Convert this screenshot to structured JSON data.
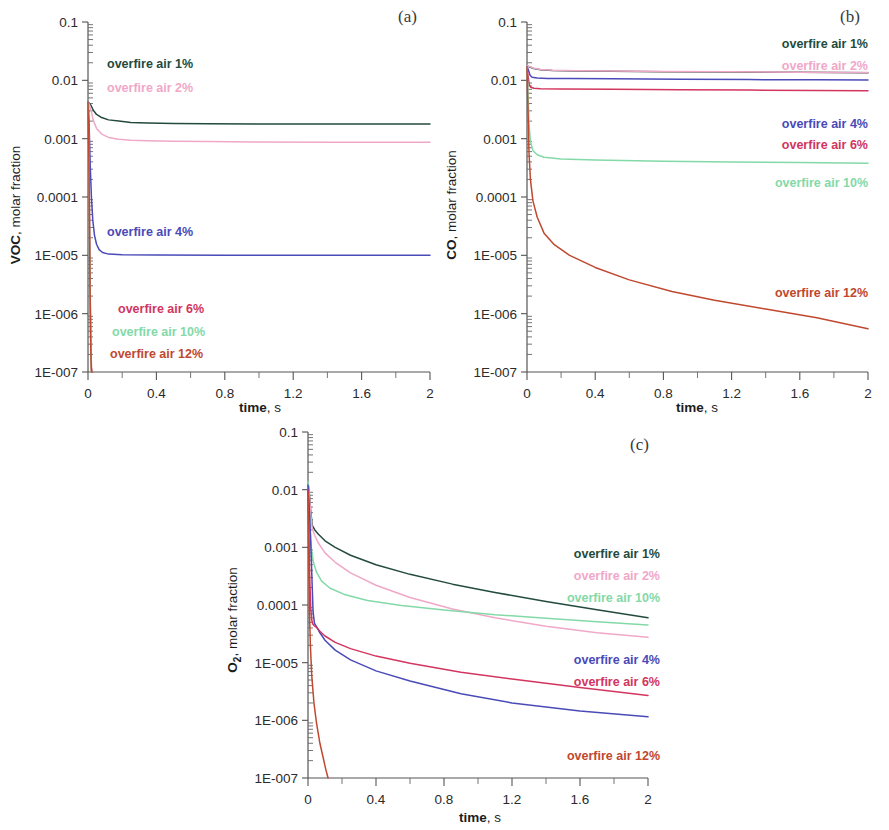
{
  "figure": {
    "panels": [
      {
        "tag": "(a)",
        "species": "VOC",
        "ylabel_unit": ", molar fraction",
        "xlabel_bold": "time",
        "xlabel_rest": ", s"
      },
      {
        "tag": "(b)",
        "species": "CO",
        "ylabel_unit": ", molar fraction",
        "xlabel_bold": "time",
        "xlabel_rest": ", s"
      },
      {
        "tag": "(c)",
        "species": "O2",
        "species_sub": "2",
        "ylabel_unit": ", molar fraction",
        "xlabel_bold": "time",
        "xlabel_rest": ", s"
      }
    ],
    "y_tick_labels": [
      "0.1",
      "0.01",
      "0.001",
      "0.0001",
      "1E-005",
      "1E-006",
      "1E-007"
    ],
    "x_tick_labels": [
      "0",
      "0.4",
      "0.8",
      "1.2",
      "1.6",
      "2"
    ],
    "series_colors": {
      "1%": "#234b3d",
      "2%": "#f0a8c8",
      "4%": "#4a4ab8",
      "6%": "#d2355f",
      "10%": "#84d9a8",
      "12%": "#c0482f"
    },
    "legend_labels": {
      "p1": "overfire air 1%",
      "p2": "overfire air 2%",
      "p4": "overfire air 4%",
      "p6": "overfire air 6%",
      "p10": "overfire air 10%",
      "p12": "overfire air 12%"
    }
  },
  "chart_data": [
    {
      "type": "line",
      "title": "(a)",
      "xlabel": "time, s",
      "ylabel": "VOC, molar fraction",
      "xlim": [
        0,
        2
      ],
      "ylim": [
        1e-07,
        0.1
      ],
      "yscale": "log",
      "grid": false,
      "legend_position": "inside-plot",
      "xticks": [
        0,
        0.4,
        0.8,
        1.2,
        1.6,
        2
      ],
      "yticks": [
        0.1,
        0.01,
        0.001,
        0.0001,
        1e-05,
        1e-06,
        1e-07
      ],
      "series": [
        {
          "name": "overfire air 1%",
          "color": "#234b3d",
          "x": [
            0,
            0.005,
            0.01,
            0.02,
            0.03,
            0.05,
            0.08,
            0.12,
            0.18,
            0.25,
            0.35,
            0.5,
            0.7,
            1.0,
            1.4,
            1.7,
            2.0
          ],
          "y": [
            0.0042,
            0.0041,
            0.004,
            0.0036,
            0.0031,
            0.0026,
            0.0023,
            0.0021,
            0.002,
            0.0019,
            0.00186,
            0.00182,
            0.0018,
            0.00179,
            0.00178,
            0.00178,
            0.00178
          ]
        },
        {
          "name": "overfire air 2%",
          "color": "#f0a8c8",
          "x": [
            0,
            0.005,
            0.01,
            0.02,
            0.03,
            0.05,
            0.08,
            0.12,
            0.18,
            0.25,
            0.35,
            0.5,
            0.7,
            1.0,
            1.4,
            1.7,
            2.0
          ],
          "y": [
            0.0042,
            0.004,
            0.0037,
            0.0029,
            0.0021,
            0.0015,
            0.0012,
            0.00105,
            0.00098,
            0.00094,
            0.00092,
            0.0009,
            0.00089,
            0.00088,
            0.00087,
            0.00087,
            0.00087
          ]
        },
        {
          "name": "overfire air 4%",
          "color": "#4a4ab8",
          "x": [
            0,
            0.004,
            0.008,
            0.013,
            0.02,
            0.028,
            0.038,
            0.05,
            0.065,
            0.085,
            0.12,
            0.2,
            0.4,
            0.8,
            1.2,
            1.6,
            2.0
          ],
          "y": [
            0.0042,
            0.003,
            0.0012,
            0.00035,
            0.0001,
            4e-05,
            2.2e-05,
            1.55e-05,
            1.25e-05,
            1.12e-05,
            1.05e-05,
            1.02e-05,
            1.01e-05,
            1e-05,
            1e-05,
            1e-05,
            1e-05
          ]
        },
        {
          "name": "overfire air 6%",
          "color": "#d2355f",
          "x": [
            0,
            0.004,
            0.008,
            0.012,
            0.016,
            0.02,
            0.024
          ],
          "y": [
            0.0042,
            0.001,
            8e-05,
            4e-06,
            4e-07,
            1.2e-07,
            5e-08
          ]
        },
        {
          "name": "overfire air 10%",
          "color": "#84d9a8",
          "x": [
            0,
            0.004,
            0.008,
            0.012,
            0.016,
            0.02,
            0.024
          ],
          "y": [
            0.0042,
            0.0009,
            6e-05,
            3e-06,
            3e-07,
            1e-07,
            4e-08
          ]
        },
        {
          "name": "overfire air 12%",
          "color": "#c0482f",
          "x": [
            0,
            0.004,
            0.008,
            0.012,
            0.016,
            0.02,
            0.024
          ],
          "y": [
            0.0042,
            0.0008,
            5e-05,
            2.5e-06,
            2.5e-07,
            9e-08,
            4e-08
          ]
        }
      ]
    },
    {
      "type": "line",
      "title": "(b)",
      "xlabel": "time, s",
      "ylabel": "CO, molar fraction",
      "xlim": [
        0,
        2
      ],
      "ylim": [
        1e-07,
        0.1
      ],
      "yscale": "log",
      "grid": false,
      "legend_position": "right-inside",
      "xticks": [
        0,
        0.4,
        0.8,
        1.2,
        1.6,
        2
      ],
      "yticks": [
        0.1,
        0.01,
        0.001,
        0.0001,
        1e-05,
        1e-06,
        1e-07
      ],
      "series": [
        {
          "name": "overfire air 1%",
          "color": "#234b3d",
          "x": [
            0,
            0.01,
            0.02,
            0.04,
            0.08,
            0.15,
            0.3,
            0.5,
            0.8,
            1.2,
            1.6,
            2.0
          ],
          "y": [
            0.0175,
            0.0172,
            0.0168,
            0.016,
            0.0152,
            0.0148,
            0.0145,
            0.0143,
            0.0141,
            0.0139,
            0.0137,
            0.0135
          ]
        },
        {
          "name": "overfire air 2%",
          "color": "#f0a8c8",
          "x": [
            0,
            0.01,
            0.02,
            0.04,
            0.08,
            0.15,
            0.3,
            0.5,
            0.8,
            1.2,
            1.6,
            2.0
          ],
          "y": [
            0.0178,
            0.0174,
            0.017,
            0.0161,
            0.0153,
            0.0149,
            0.0146,
            0.0144,
            0.0142,
            0.014,
            0.0138,
            0.0136
          ]
        },
        {
          "name": "overfire air 4%",
          "color": "#4a4ab8",
          "x": [
            0,
            0.008,
            0.018,
            0.03,
            0.06,
            0.12,
            0.25,
            0.5,
            0.9,
            1.3,
            1.7,
            2.0
          ],
          "y": [
            0.0172,
            0.015,
            0.0122,
            0.0113,
            0.011,
            0.0108,
            0.0107,
            0.0106,
            0.0104,
            0.0103,
            0.0102,
            0.0101
          ]
        },
        {
          "name": "overfire air 6%",
          "color": "#d2355f",
          "x": [
            0,
            0.006,
            0.013,
            0.022,
            0.04,
            0.08,
            0.2,
            0.5,
            0.9,
            1.3,
            1.7,
            2.0
          ],
          "y": [
            0.017,
            0.012,
            0.0085,
            0.0076,
            0.0073,
            0.0072,
            0.0071,
            0.007,
            0.0069,
            0.0068,
            0.0067,
            0.0066
          ]
        },
        {
          "name": "overfire air 10%",
          "color": "#84d9a8",
          "x": [
            0,
            0.006,
            0.012,
            0.02,
            0.035,
            0.06,
            0.1,
            0.2,
            0.4,
            0.8,
            1.2,
            1.6,
            2.0
          ],
          "y": [
            0.0168,
            0.006,
            0.0018,
            0.0009,
            0.00062,
            0.00053,
            0.00048,
            0.00045,
            0.00043,
            0.00041,
            0.0004,
            0.00039,
            0.00038
          ]
        },
        {
          "name": "overfire air 12%",
          "color": "#c0482f",
          "x": [
            0,
            0.006,
            0.012,
            0.02,
            0.035,
            0.06,
            0.1,
            0.16,
            0.25,
            0.4,
            0.6,
            0.85,
            1.1,
            1.4,
            1.7,
            2.0
          ],
          "y": [
            0.0165,
            0.003,
            0.00055,
            0.0002,
            8.5e-05,
            4.5e-05,
            2.4e-05,
            1.52e-05,
            1e-05,
            6.2e-06,
            3.8e-06,
            2.4e-06,
            1.7e-06,
            1.2e-06,
            8.5e-07,
            5.5e-07
          ]
        }
      ]
    },
    {
      "type": "line",
      "title": "(c)",
      "xlabel": "time, s",
      "ylabel": "O2, molar fraction",
      "xlim": [
        0,
        2
      ],
      "ylim": [
        1e-07,
        0.1
      ],
      "yscale": "log",
      "grid": false,
      "legend_position": "right-inside",
      "xticks": [
        0,
        0.4,
        0.8,
        1.2,
        1.6,
        2
      ],
      "yticks": [
        0.1,
        0.01,
        0.001,
        0.0001,
        1e-05,
        1e-06,
        1e-07
      ],
      "series": [
        {
          "name": "overfire air 1%",
          "color": "#234b3d",
          "x": [
            0,
            0.008,
            0.016,
            0.025,
            0.04,
            0.06,
            0.1,
            0.16,
            0.25,
            0.4,
            0.6,
            0.85,
            1.1,
            1.4,
            1.7,
            2.0
          ],
          "y": [
            0.0135,
            0.0085,
            0.0042,
            0.0024,
            0.002,
            0.0017,
            0.0013,
            0.001,
            0.00073,
            0.0005,
            0.00034,
            0.00023,
            0.000165,
            0.000115,
            8.3e-05,
            6e-05
          ]
        },
        {
          "name": "overfire air 2%",
          "color": "#f0a8c8",
          "x": [
            0,
            0.008,
            0.016,
            0.025,
            0.04,
            0.06,
            0.1,
            0.16,
            0.25,
            0.4,
            0.6,
            0.85,
            1.1,
            1.4,
            1.7,
            2.0
          ],
          "y": [
            0.013,
            0.008,
            0.0038,
            0.0021,
            0.0016,
            0.0012,
            0.0008,
            0.00055,
            0.00036,
            0.00022,
            0.000135,
            8.5e-05,
            6e-05,
            4.3e-05,
            3.3e-05,
            2.75e-05
          ]
        },
        {
          "name": "overfire air 10%",
          "color": "#84d9a8",
          "x": [
            0,
            0.006,
            0.012,
            0.02,
            0.032,
            0.05,
            0.08,
            0.13,
            0.22,
            0.35,
            0.55,
            0.8,
            1.1,
            1.4,
            1.7,
            2.0
          ],
          "y": [
            0.014,
            0.006,
            0.0022,
            0.00095,
            0.00055,
            0.00037,
            0.00026,
            0.000195,
            0.00015,
            0.00012,
            9.8e-05,
            8.2e-05,
            6.8e-05,
            5.9e-05,
            5.1e-05,
            4.5e-05
          ]
        },
        {
          "name": "overfire air 4%",
          "color": "#4a4ab8",
          "x": [
            0,
            0.006,
            0.012,
            0.018,
            0.024,
            0.03,
            0.038,
            0.05,
            0.07,
            0.1,
            0.16,
            0.25,
            0.4,
            0.6,
            0.9,
            1.2,
            1.6,
            2.0
          ],
          "y": [
            0.012,
            0.006,
            0.0024,
            0.00085,
            0.00024,
            7.5e-05,
            4.8e-05,
            4.2e-05,
            3.3e-05,
            2.45e-05,
            1.65e-05,
            1.12e-05,
            7.2e-06,
            4.8e-06,
            2.9e-06,
            2e-06,
            1.45e-06,
            1.15e-06
          ]
        },
        {
          "name": "overfire air 6%",
          "color": "#d2355f",
          "x": [
            0,
            0.005,
            0.01,
            0.016,
            0.022,
            0.028,
            0.036,
            0.05,
            0.07,
            0.1,
            0.16,
            0.25,
            0.4,
            0.6,
            0.9,
            1.2,
            1.6,
            2.0
          ],
          "y": [
            0.01,
            0.002,
            0.0003,
            9e-05,
            5.5e-05,
            4.7e-05,
            4.4e-05,
            4.1e-05,
            3.5e-05,
            2.9e-05,
            2.25e-05,
            1.75e-05,
            1.3e-05,
            9.8e-06,
            6.8e-06,
            5.2e-06,
            3.7e-06,
            2.7e-06
          ]
        },
        {
          "name": "overfire air 12%",
          "color": "#c0482f",
          "x": [
            0,
            0.004,
            0.008,
            0.014,
            0.022,
            0.035,
            0.05,
            0.07,
            0.09,
            0.105,
            0.118
          ],
          "y": [
            0.009,
            0.0008,
            9e-05,
            2e-05,
            6e-06,
            2e-06,
            9e-07,
            4e-07,
            2.2e-07,
            1.4e-07,
            1e-07
          ]
        }
      ]
    }
  ],
  "panel_a_legend": [
    {
      "key": "p1",
      "x": 107,
      "y": 68,
      "color": "#234b3d",
      "anchor": "start"
    },
    {
      "key": "p2",
      "x": 107,
      "y": 92,
      "color": "#f0a8c8",
      "anchor": "start"
    },
    {
      "key": "p4",
      "x": 107,
      "y": 236,
      "color": "#4a4ab8",
      "anchor": "start"
    },
    {
      "key": "p6",
      "x": 118,
      "y": 313,
      "color": "#d2355f",
      "anchor": "start"
    },
    {
      "key": "p10",
      "x": 112,
      "y": 336,
      "color": "#84d9a8",
      "anchor": "start"
    },
    {
      "key": "p12",
      "x": 110,
      "y": 358,
      "color": "#c0482f",
      "anchor": "start"
    }
  ],
  "panel_b_legend": [
    {
      "key": "p1",
      "x": 426,
      "y": 48,
      "color": "#234b3d",
      "anchor": "end"
    },
    {
      "key": "p2",
      "x": 426,
      "y": 70,
      "color": "#f0a8c8",
      "anchor": "end"
    },
    {
      "key": "p4",
      "x": 426,
      "y": 128,
      "color": "#4a4ab8",
      "anchor": "end"
    },
    {
      "key": "p6",
      "x": 426,
      "y": 149,
      "color": "#d2355f",
      "anchor": "end"
    },
    {
      "key": "p10",
      "x": 426,
      "y": 187,
      "color": "#84d9a8",
      "anchor": "end"
    },
    {
      "key": "p12",
      "x": 426,
      "y": 297,
      "color": "#c0482f",
      "anchor": "end"
    }
  ],
  "panel_c_legend": [
    {
      "key": "p1",
      "x": 440,
      "y": 138,
      "color": "#234b3d",
      "anchor": "end"
    },
    {
      "key": "p2",
      "x": 440,
      "y": 160,
      "color": "#f0a8c8",
      "anchor": "end"
    },
    {
      "key": "p10",
      "x": 440,
      "y": 182,
      "color": "#84d9a8",
      "anchor": "end"
    },
    {
      "key": "p4",
      "x": 440,
      "y": 244,
      "color": "#4a4ab8",
      "anchor": "end"
    },
    {
      "key": "p6",
      "x": 440,
      "y": 266,
      "color": "#d2355f",
      "anchor": "end"
    },
    {
      "key": "p12",
      "x": 440,
      "y": 340,
      "color": "#c0482f",
      "anchor": "end"
    }
  ]
}
